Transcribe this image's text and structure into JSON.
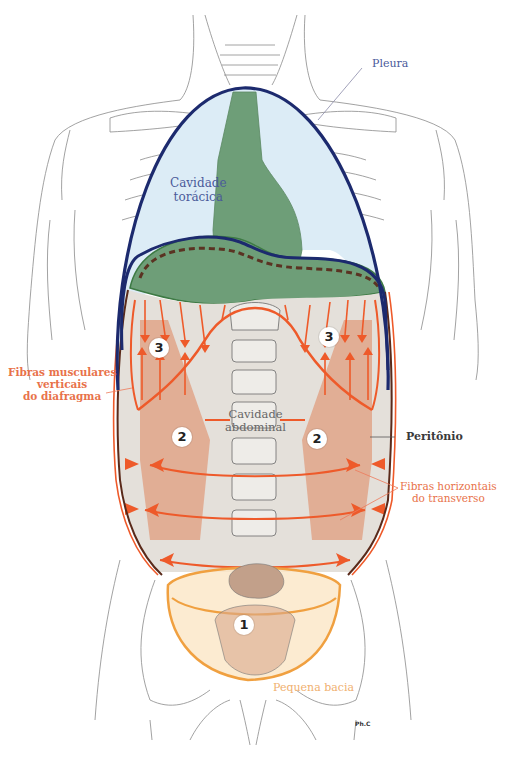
{
  "diagram": {
    "labels": {
      "pleura": "Pleura",
      "thoracic_cavity": [
        "Cavidade",
        "torácica"
      ],
      "abdominal_cavity": [
        "Cavidade",
        "abdominal"
      ],
      "vertical_fibers": [
        "Fibras musculares",
        "verticais",
        "do diafragma"
      ],
      "peritoneum": "Peritônio",
      "horizontal_fibers": [
        "Fibras horizontais",
        "do transverso"
      ],
      "small_pelvis": "Pequena bacia",
      "signature": "Ph.C"
    },
    "markers": [
      {
        "id": "1",
        "label": "1"
      },
      {
        "id": "2-left",
        "label": "2"
      },
      {
        "id": "2-right",
        "label": "2"
      },
      {
        "id": "3-left",
        "label": "3"
      },
      {
        "id": "3-right",
        "label": "3"
      }
    ],
    "colors": {
      "pleura_outline": "#1c2a6e",
      "thoracic_fill": "#dcecf6",
      "mediastinum_green": "#6e9e78",
      "abdomen_fill": "#e4e0da",
      "fiber_orange": "#ee5a2a",
      "muscle_band": "#e0a488",
      "pelvis_outline": "#f0a040",
      "pelvis_fill": "#fbe6c6",
      "peritoneum_dark": "#5a2a1a",
      "outline_gray": "#7a7a7a"
    }
  }
}
